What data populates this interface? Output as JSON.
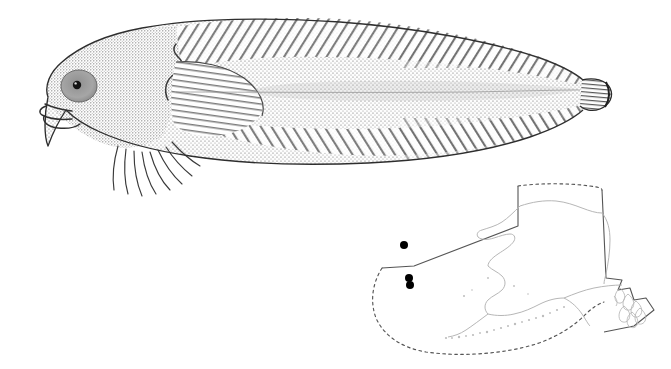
{
  "plate": {
    "kind": "scientific-species-plate",
    "background_color": "#ffffff",
    "width": 671,
    "height": 369,
    "panels": [
      "fish-illustration",
      "distribution-map"
    ]
  },
  "illustration": {
    "subject": "snailfish",
    "technique": "stipple-and-line pen-and-ink",
    "orientation": "lateral view, head to the left",
    "ink_color": "#2b2b2b",
    "stipple_color": "#6e6e6e",
    "fill_color": "#d8d8d8",
    "parts": [
      {
        "name": "head",
        "label": "head"
      },
      {
        "name": "eye",
        "label": "eye"
      },
      {
        "name": "mouth",
        "label": "mouth"
      },
      {
        "name": "pectoral-fin",
        "label": "pectoral fin"
      },
      {
        "name": "pectoral-lower-rays",
        "label": "lower pectoral rays"
      },
      {
        "name": "dorsal-fin",
        "label": "dorsal fin"
      },
      {
        "name": "anal-fin",
        "label": "anal fin"
      },
      {
        "name": "caudal-fin",
        "label": "caudal fin"
      },
      {
        "name": "lateral-midline",
        "label": "lateral midline"
      },
      {
        "name": "gill-opening",
        "label": "gill opening"
      }
    ]
  },
  "map": {
    "region_label": "Alaska",
    "coastline_color": "#b2b2b2",
    "boundary_color": "#555555",
    "eez_color": "#555555",
    "eez_style": "dashed",
    "point_color": "#000000",
    "point_radius": 4,
    "occurrence_points": [
      {
        "id": "point-1",
        "x": 36,
        "y": 77,
        "label": "record 1"
      },
      {
        "id": "point-2",
        "x": 41,
        "y": 110,
        "label": "record 2"
      },
      {
        "id": "point-3",
        "x": 42,
        "y": 117,
        "label": "record 3"
      }
    ],
    "features": [
      {
        "name": "alaska-mainland",
        "label": "Alaska mainland"
      },
      {
        "name": "aleutian-chain",
        "label": "Aleutian Islands"
      },
      {
        "name": "southeast-panhandle",
        "label": "Southeast Alaska panhandle"
      },
      {
        "name": "eez-boundary",
        "label": "EEZ boundary"
      },
      {
        "name": "state-boundary",
        "label": "state boundary"
      }
    ]
  }
}
